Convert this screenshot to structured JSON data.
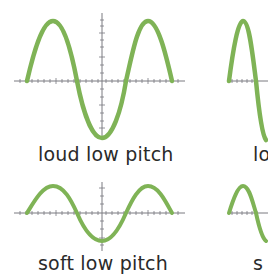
{
  "colors": {
    "wave": "#7fb356",
    "axis": "#7a7a80"
  },
  "panels": [
    {
      "label": "loud low pitch"
    },
    {
      "label": "lo"
    },
    {
      "label": "soft low pitch"
    },
    {
      "label": "s"
    }
  ]
}
